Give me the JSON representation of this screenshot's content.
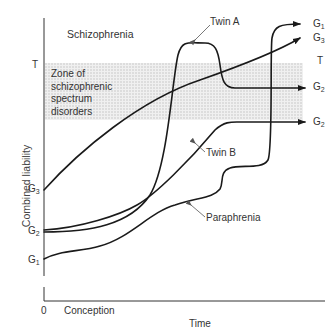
{
  "diagram": {
    "title_region_label": "Schizophrenia",
    "zone_label_lines": [
      "Zone of",
      "schizophrenic",
      "spectrum",
      "disorders"
    ],
    "y_axis_label": "Combined liability",
    "x_axis_label": "Time",
    "x_origin_label": "0",
    "x_start_label": "Conception",
    "threshold_label": "T",
    "left_axis_ticks": [
      {
        "label": "T",
        "sub": ""
      },
      {
        "label": "G",
        "sub": "3"
      },
      {
        "label": "G",
        "sub": "2"
      },
      {
        "label": "G",
        "sub": "1"
      }
    ],
    "right_end_labels": [
      {
        "label": "G",
        "sub": "1"
      },
      {
        "label": "G",
        "sub": "3"
      },
      {
        "label": "T",
        "sub": ""
      },
      {
        "label": "G",
        "sub": "2"
      },
      {
        "label": "G",
        "sub": "2"
      }
    ],
    "curve_labels": {
      "twin_a": "Twin A",
      "twin_b": "Twin B",
      "paraphrenia": "Paraphrenia"
    },
    "colors": {
      "line": "#1a1a1a",
      "zone_fill": "#e4e4e4",
      "axis": "#333333"
    }
  }
}
